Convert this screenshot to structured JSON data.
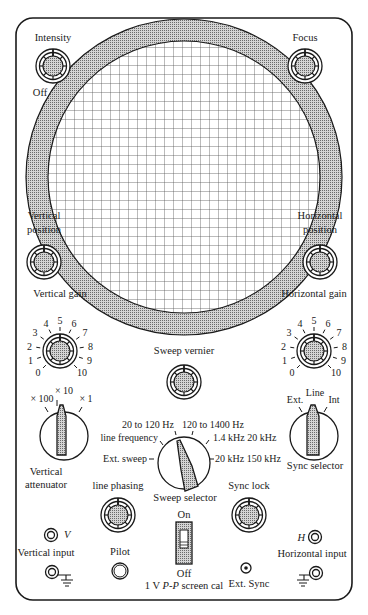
{
  "screen": {
    "name": "CRT screen with graticule",
    "grid": "square"
  },
  "knobs": {
    "intensity": {
      "label": "Intensity",
      "off_label": "Off"
    },
    "focus": {
      "label": "Focus"
    },
    "vertical_position": {
      "label_line1": "Vertical",
      "label_line2": "position"
    },
    "horizontal_position": {
      "label_line1": "Horizontal",
      "label_line2": "position"
    },
    "vertical_gain": {
      "label": "Vertical gain",
      "scale": [
        "0",
        "1",
        "2",
        "3",
        "4",
        "5",
        "6",
        "7",
        "8",
        "9",
        "10"
      ]
    },
    "horizontal_gain": {
      "label": "Horizontal gain",
      "scale": [
        "0",
        "1",
        "2",
        "3",
        "4",
        "5",
        "6",
        "7",
        "8",
        "9",
        "10"
      ]
    },
    "sweep_vernier": {
      "label": "Sweep vernier"
    },
    "line_phasing": {
      "label": "line phasing"
    },
    "sync_lock": {
      "label": "Sync  lock"
    }
  },
  "selectors": {
    "vertical_attenuator": {
      "label_line1": "Vertical",
      "label_line2": "attenuator",
      "positions": [
        "× 100",
        "× 10",
        "× 1"
      ],
      "selected": "× 10"
    },
    "sweep_selector": {
      "label": "Sweep selector",
      "positions": [
        "Ext. sweep",
        "line frequency",
        "20 to 120 Hz",
        "120 to 1400 Hz",
        "1.4 kHz 20 kHz",
        "20 kHz 150 kHz"
      ],
      "selected": "20 to 120 Hz"
    },
    "sync_selector": {
      "label": "Sync  selector",
      "positions": [
        "Ext.",
        "Line",
        "Int"
      ],
      "selected": "Line"
    }
  },
  "switch": {
    "on_label": "On",
    "off_label": "Off",
    "caption_prefix": "1 V ",
    "caption_italic": "P-P",
    "caption_suffix": " screen cal"
  },
  "jacks": {
    "vertical_input": {
      "label": "Vertical input",
      "marker": "V"
    },
    "horizontal_input": {
      "label": "Horizontal input",
      "marker": "H"
    },
    "ext_sync": {
      "label": "Ext. Sync"
    },
    "pilot": {
      "label": "Pilot"
    }
  }
}
